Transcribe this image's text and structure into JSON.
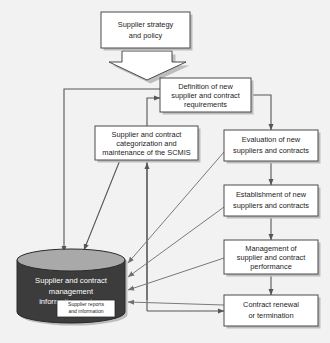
{
  "diagram": {
    "background_color": "#f2f2f2",
    "box_fill": "#ffffff",
    "box_border": "#4a4a4a",
    "shadow_color": "#bdbdbd",
    "connector_color": "#565656",
    "database_body_color": "#3c3c3c",
    "database_top_color": "#a9a9a9",
    "database_text_color": "#ffffff"
  },
  "nodes": {
    "strategy": {
      "id": "supplier-strategy-and-policy",
      "lines": [
        "Supplier strategy",
        "and policy"
      ],
      "x": 101,
      "y": 12,
      "w": 89,
      "h": 36
    },
    "definition": {
      "id": "definition-of-new-supplier-and-contract-requirements",
      "lines": [
        "Definition of new",
        "supplier and contract",
        "requirements"
      ],
      "x": 160,
      "y": 78,
      "w": 91,
      "h": 34
    },
    "categorization": {
      "id": "supplier-and-contract-categorization",
      "lines": [
        "Supplier and contract",
        "categorization and",
        "maintenance of the SCMIS"
      ],
      "x": 95,
      "y": 126,
      "w": 103,
      "h": 34
    },
    "evaluation": {
      "id": "evaluation-of-new-suppliers-and-contracts",
      "lines": [
        "Evaluation of new",
        "suppliers and contracts"
      ],
      "x": 224,
      "y": 130,
      "w": 94,
      "h": 31
    },
    "establishment": {
      "id": "establishment-of-new-suppliers-and-contracts",
      "lines": [
        "Establishment of new",
        "suppliers and contracts"
      ],
      "x": 224,
      "y": 185,
      "w": 94,
      "h": 31
    },
    "management": {
      "id": "management-of-supplier-and-contract-performance",
      "lines": [
        "Management of",
        "supplier and contract",
        "performance"
      ],
      "x": 224,
      "y": 240,
      "w": 94,
      "h": 34
    },
    "renewal": {
      "id": "contract-renewal-or-termination",
      "lines": [
        "Contract renewal",
        "or termination"
      ],
      "x": 224,
      "y": 295,
      "w": 94,
      "h": 31
    },
    "database": {
      "id": "supplier-and-contract-management-information-system",
      "lines": [
        "Supplier and contract",
        "management",
        "information system"
      ],
      "x": 17,
      "y": 248,
      "w": 108,
      "h": 74,
      "inner_label": {
        "id": "supplier-reports-and-information",
        "lines": [
          "Supplier reports",
          "and information"
        ],
        "x": 57,
        "y": 300,
        "w": 58,
        "h": 17
      }
    }
  },
  "flows": [
    {
      "id": "strategy-to-definition",
      "from": "supplier-strategy-and-policy",
      "to": "definition-of-new-supplier-and-contract-requirements",
      "style": "block-arrow"
    },
    {
      "id": "definition-to-evaluation",
      "from": "definition-of-new-supplier-and-contract-requirements",
      "to": "evaluation-of-new-suppliers-and-contracts",
      "style": "elbow"
    },
    {
      "id": "evaluation-to-establishment",
      "from": "evaluation-of-new-suppliers-and-contracts",
      "to": "establishment-of-new-suppliers-and-contracts",
      "style": "straight"
    },
    {
      "id": "establishment-to-management",
      "from": "establishment-of-new-suppliers-and-contracts",
      "to": "management-of-supplier-and-contract-performance",
      "style": "straight"
    },
    {
      "id": "management-to-renewal",
      "from": "management-of-supplier-and-contract-performance",
      "to": "contract-renewal-or-termination",
      "style": "straight"
    },
    {
      "id": "renewal-to-definition",
      "from": "contract-renewal-or-termination",
      "to": "definition-of-new-supplier-and-contract-requirements",
      "style": "feedback-elbow"
    },
    {
      "id": "definition-to-database",
      "from": "definition-of-new-supplier-and-contract-requirements",
      "to": "supplier-and-contract-management-information-system",
      "style": "elbow-left"
    },
    {
      "id": "categorization-to-database",
      "from": "supplier-and-contract-categorization",
      "to": "supplier-and-contract-management-information-system",
      "style": "diagonal"
    },
    {
      "id": "database-to-categorization",
      "from": "supplier-and-contract-management-information-system",
      "to": "supplier-and-contract-categorization",
      "style": "vertical-up"
    },
    {
      "id": "evaluation-to-database",
      "from": "evaluation-of-new-suppliers-and-contracts",
      "to": "supplier-and-contract-management-information-system",
      "style": "diagonal"
    },
    {
      "id": "establishment-to-database",
      "from": "establishment-of-new-suppliers-and-contracts",
      "to": "supplier-and-contract-management-information-system",
      "style": "diagonal"
    },
    {
      "id": "management-to-database",
      "from": "management-of-supplier-and-contract-performance",
      "to": "supplier-and-contract-management-information-system",
      "style": "diagonal"
    },
    {
      "id": "renewal-to-database",
      "from": "contract-renewal-or-termination",
      "to": "supplier-and-contract-management-information-system",
      "style": "diagonal"
    }
  ]
}
